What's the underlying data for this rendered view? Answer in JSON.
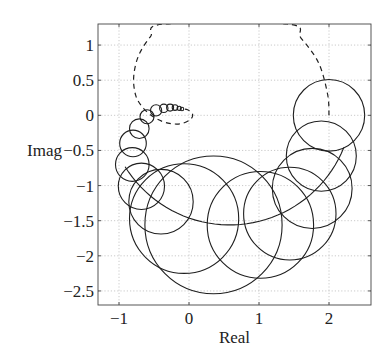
{
  "chart_data": {
    "type": "scatter",
    "title": "",
    "xlabel": "Real",
    "ylabel": "Imag",
    "xlim": [
      -1.3,
      2.6
    ],
    "ylim": [
      -2.7,
      1.3
    ],
    "xticks": [
      -1,
      0,
      1,
      2
    ],
    "xtick_labels": [
      "−1",
      "0",
      "1",
      "2"
    ],
    "yticks": [
      1,
      0.5,
      0,
      -0.5,
      -1,
      -1.5,
      -2,
      -2.5
    ],
    "ytick_labels": [
      "1",
      "0.5",
      "0",
      "−0.5",
      "−1",
      "−1.5",
      "−2",
      "−2.5"
    ],
    "grid": true,
    "legend": null,
    "series": [
      {
        "name": "uncertainty circles",
        "style": "solid",
        "circles": [
          {
            "re": -0.1,
            "im": 0.09,
            "r": 0.025
          },
          {
            "re": -0.14,
            "im": 0.1,
            "r": 0.03
          },
          {
            "re": -0.2,
            "im": 0.11,
            "r": 0.04
          },
          {
            "re": -0.27,
            "im": 0.11,
            "r": 0.05
          },
          {
            "re": -0.36,
            "im": 0.1,
            "r": 0.06
          },
          {
            "re": -0.47,
            "im": 0.07,
            "r": 0.08
          },
          {
            "re": -0.6,
            "im": -0.02,
            "r": 0.1
          },
          {
            "re": -0.71,
            "im": -0.19,
            "r": 0.14
          },
          {
            "re": -0.8,
            "im": -0.4,
            "r": 0.19
          },
          {
            "re": -0.81,
            "im": -0.7,
            "r": 0.24
          },
          {
            "re": -0.68,
            "im": -1.01,
            "r": 0.33
          },
          {
            "re": -0.4,
            "im": -1.23,
            "r": 0.46
          },
          {
            "re": -0.07,
            "im": -1.47,
            "r": 0.78
          },
          {
            "re": 0.35,
            "im": -1.56,
            "r": 0.98
          },
          {
            "re": 1.02,
            "im": -1.56,
            "r": 0.76
          },
          {
            "re": 1.44,
            "im": -1.4,
            "r": 0.66
          },
          {
            "re": 1.76,
            "im": -1.04,
            "r": 0.57
          },
          {
            "re": 1.89,
            "im": -0.58,
            "r": 0.5
          },
          {
            "re": 2.0,
            "im": 0.0,
            "r": 0.51
          }
        ],
        "arc": {
          "re": 0.58,
          "im": 0.2,
          "r": 1.76,
          "from_deg": 212,
          "to_deg": 338
        }
      },
      {
        "name": "nominal curve",
        "style": "dashed",
        "points": [
          [
            2.0,
            0.0
          ],
          [
            1.98,
            0.3
          ],
          [
            1.85,
            0.75
          ],
          [
            1.6,
            1.1
          ],
          [
            1.4,
            1.3
          ],
          [
            -0.35,
            1.3
          ],
          [
            -0.55,
            1.12
          ],
          [
            -0.72,
            0.85
          ],
          [
            -0.79,
            0.55
          ],
          [
            -0.76,
            0.28
          ],
          [
            -0.65,
            0.1
          ],
          [
            -0.48,
            -0.04
          ],
          [
            -0.3,
            -0.11
          ],
          [
            -0.12,
            -0.12
          ],
          [
            0.02,
            -0.06
          ],
          [
            0.05,
            0.02
          ],
          [
            -0.02,
            0.08
          ],
          [
            -0.08,
            0.09
          ]
        ]
      }
    ]
  }
}
